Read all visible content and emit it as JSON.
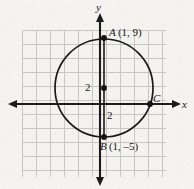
{
  "figure": {
    "type": "coordinate-plane-circle-diagram",
    "background_color": "#f4f3f0",
    "ink_color": "#171717",
    "grid_color": "#c9c7c4"
  },
  "axes": {
    "x_label": "x",
    "y_label": "y",
    "x_axis_y_px": 104,
    "y_axis_x_px": 100,
    "grid_spacing_px": 14,
    "grid_left_px": 22,
    "grid_right_px": 166,
    "grid_top_px": 30,
    "grid_bottom_px": 177
  },
  "ticks": {
    "radius_vertical_upper": "2",
    "radius_vertical_lower": "2"
  },
  "points": [
    {
      "name": "A",
      "label_name": "A",
      "label_coords": "(1, 9)",
      "x": 1,
      "y": 9,
      "px": 104,
      "py": 38
    },
    {
      "name": "B",
      "label_name": "B",
      "label_coords": "(1, –5)",
      "x": 1,
      "y": -5,
      "px": 104,
      "py": 137
    },
    {
      "name": "C",
      "label_name": "C",
      "label_coords": "",
      "px": 150,
      "py": 104
    },
    {
      "name": "center",
      "label_name": "",
      "label_coords": "",
      "x": 1,
      "y": 2,
      "px": 104,
      "py": 88
    }
  ],
  "circle": {
    "center_px": [
      104,
      88
    ],
    "radius_px": 49,
    "stroke": "#1a1a1a",
    "stroke_width": 1.6
  },
  "chord": {
    "from": "A",
    "to": "B",
    "description": "vertical diameter segment from A to B through center"
  }
}
